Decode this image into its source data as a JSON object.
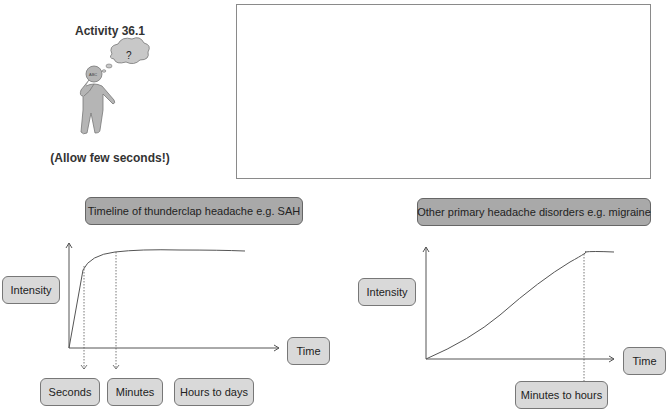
{
  "activity": {
    "title": "Activity 36.1",
    "note": "(Allow few seconds!)",
    "figure_icon": "thinking-person-icon",
    "thought_bubble_text": "?",
    "head_text": "ABC"
  },
  "answer_box": {
    "content": ""
  },
  "left_panel": {
    "title": "Timeline of thunderclap headache e.g. SAH",
    "y_label": "Intensity",
    "x_label": "Time",
    "time_labels": [
      "Seconds",
      "Minutes",
      "Hours to days"
    ]
  },
  "right_panel": {
    "title": "Other primary headache disorders e.g. migraine",
    "y_label": "Intensity",
    "x_label": "Time",
    "time_labels": [
      "Minutes to hours"
    ]
  },
  "colors": {
    "title_box": "#a9a9a9",
    "label_box": "#d9d9d9",
    "line": "#555555",
    "figure": "#b5b5b5"
  }
}
